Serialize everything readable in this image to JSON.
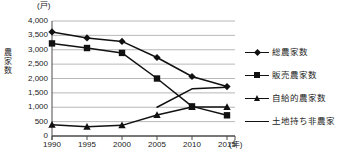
{
  "chart_data": {
    "type": "line",
    "title": "",
    "xlabel": "(年)",
    "ylabel": "農家数",
    "yunit": "(戸)",
    "x": [
      1990,
      1995,
      2000,
      2005,
      2010,
      2015
    ],
    "xticklabels": [
      "1990",
      "1995",
      "2000",
      "2005",
      "2010",
      "2015"
    ],
    "yticklabels": [
      "4,000",
      "3,500",
      "3,000",
      "2,500",
      "2,000",
      "1,500",
      "1,000",
      "500",
      "0"
    ],
    "yticks": [
      4000,
      3500,
      3000,
      2500,
      2000,
      1500,
      1000,
      500,
      0
    ],
    "ylim": [
      0,
      4000
    ],
    "grid": true,
    "legend_position": "right",
    "series": [
      {
        "name": "総農家数",
        "marker": "diamond",
        "color": "#111111",
        "values": [
          3620,
          3410,
          3290,
          2730,
          2070,
          1720
        ]
      },
      {
        "name": "販売農家数",
        "marker": "square",
        "color": "#111111",
        "values": [
          3220,
          3060,
          2890,
          2000,
          1030,
          720
        ]
      },
      {
        "name": "自給的農家数",
        "marker": "triangle",
        "color": "#111111",
        "values": [
          390,
          320,
          370,
          730,
          1010,
          1010
        ]
      },
      {
        "name": "土地持ち非農家",
        "marker": "none",
        "color": "#111111",
        "values": [
          null,
          null,
          null,
          1000,
          1640,
          1700
        ]
      }
    ]
  },
  "legend": {
    "items": [
      {
        "label": "総農家数",
        "marker": "diamond"
      },
      {
        "label": "販売農家数",
        "marker": "square"
      },
      {
        "label": "自給的農家数",
        "marker": "triangle"
      },
      {
        "label": "土地持ち非農家",
        "marker": "none"
      }
    ]
  },
  "axes": {
    "y_unit_label": "(戸)",
    "y_axis_title": "農家数",
    "x_unit_label": "(年)"
  }
}
